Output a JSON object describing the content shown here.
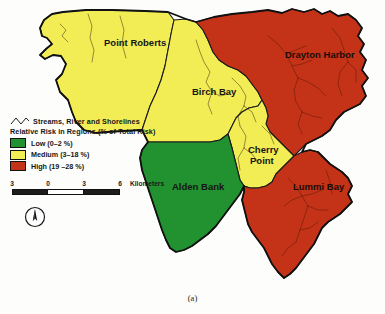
{
  "figure": {
    "caption": "(a)"
  },
  "map": {
    "regions": [
      {
        "id": "point-roberts",
        "label": "Point Roberts",
        "risk_class": "Medium",
        "color": "#f2ed54"
      },
      {
        "id": "birch-bay",
        "label": "Birch Bay",
        "risk_class": "Medium",
        "color": "#f2ed54"
      },
      {
        "id": "drayton-harbor",
        "label": "Drayton Harbor",
        "risk_class": "High",
        "color": "#c43318"
      },
      {
        "id": "cherry-point",
        "label": "Cherry Point",
        "risk_class": "Medium",
        "color": "#f2ed54"
      },
      {
        "id": "alden-bank",
        "label": "Alden Bank",
        "risk_class": "Low",
        "color": "#21922f"
      },
      {
        "id": "lummi-bay",
        "label": "Lummi Bay",
        "risk_class": "High",
        "color": "#c43318"
      }
    ]
  },
  "legend": {
    "streams_label": "Streams, River and Shorelines",
    "title": "Relative Risk in Regions (% of Total Risk)",
    "entries": [
      {
        "label": "Low (0–2 %)",
        "color": "#21922f"
      },
      {
        "label": "Medium (3–18 %)",
        "color": "#f2ed54"
      },
      {
        "label": "High (19 –28 %)",
        "color": "#c43318"
      }
    ]
  },
  "scalebar": {
    "ticks": [
      "3",
      "0",
      "3",
      "6"
    ],
    "unit": "Kilometers"
  },
  "north_arrow": {
    "name": "north-arrow"
  }
}
